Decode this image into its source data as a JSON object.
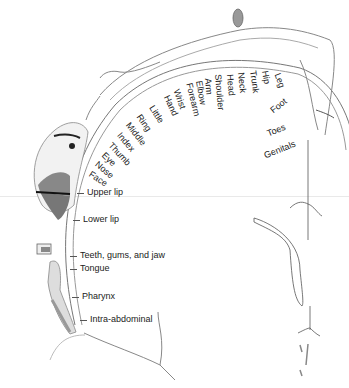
{
  "diagram": {
    "divider_color": "#e9e9e9",
    "line_color": "#555555",
    "fill_dark": "#555555",
    "fill_mid": "#999999",
    "fill_light": "#dddddd",
    "arc_labels": [
      {
        "text": "Genitals",
        "x": 263,
        "y": 152,
        "rot": -22
      },
      {
        "text": "Toes",
        "x": 266,
        "y": 130,
        "rot": -22
      },
      {
        "text": "Foot",
        "x": 269,
        "y": 108,
        "rot": -38
      },
      {
        "text": "Leg",
        "x": 281,
        "y": 72,
        "rot": 70
      },
      {
        "text": "Hip",
        "x": 269,
        "y": 70,
        "rot": 80
      },
      {
        "text": "Trunk",
        "x": 257,
        "y": 70,
        "rot": 82
      },
      {
        "text": "Neck",
        "x": 245,
        "y": 72,
        "rot": 84
      },
      {
        "text": "Head",
        "x": 234,
        "y": 74,
        "rot": 85
      },
      {
        "text": "Shoulder",
        "x": 222,
        "y": 74,
        "rot": 85
      },
      {
        "text": "Arm",
        "x": 212,
        "y": 78,
        "rot": 85
      },
      {
        "text": "Elbow",
        "x": 203,
        "y": 80,
        "rot": 80
      },
      {
        "text": "Forearm",
        "x": 193,
        "y": 82,
        "rot": 76
      },
      {
        "text": "Wrist",
        "x": 180,
        "y": 88,
        "rot": 70
      },
      {
        "text": "Hand",
        "x": 170,
        "y": 94,
        "rot": 65
      },
      {
        "text": "Little",
        "x": 155,
        "y": 104,
        "rot": 58
      },
      {
        "text": "Ring",
        "x": 142,
        "y": 113,
        "rot": 55
      },
      {
        "text": "Middle",
        "x": 131,
        "y": 121,
        "rot": 52
      },
      {
        "text": "Index",
        "x": 122,
        "y": 131,
        "rot": 50
      },
      {
        "text": "Thumb",
        "x": 113,
        "y": 141,
        "rot": 47
      },
      {
        "text": "Eye",
        "x": 106,
        "y": 151,
        "rot": 44
      },
      {
        "text": "Nose",
        "x": 99,
        "y": 160,
        "rot": 40
      },
      {
        "text": "Face",
        "x": 92,
        "y": 170,
        "rot": 33
      }
    ],
    "side_labels": [
      {
        "text": "Upper lip",
        "x": 87,
        "y": 188
      },
      {
        "text": "Lower lip",
        "x": 83,
        "y": 215
      },
      {
        "text": "Teeth, gums, and jaw",
        "x": 80,
        "y": 251
      },
      {
        "text": "Tongue",
        "x": 80,
        "y": 264
      },
      {
        "text": "Pharynx",
        "x": 82,
        "y": 292
      },
      {
        "text": "Intra-abdominal",
        "x": 90,
        "y": 315
      }
    ]
  }
}
